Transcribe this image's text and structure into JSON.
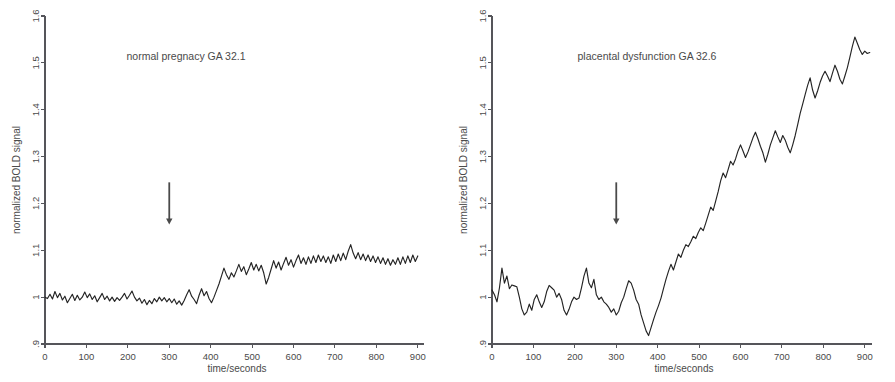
{
  "figure": {
    "panel_count": 2,
    "background_color": "#ffffff",
    "trace_color": "#242424",
    "axis_color": "#55555a",
    "text_color": "#4a4a4a"
  },
  "panels": [
    {
      "key": "normal",
      "title": "normal pregnacy GA 32.1",
      "xlabel": "time/seconds",
      "ylabel": "normalized BOLD signal",
      "annotation": {
        "label": "onset-arrow",
        "x": 300,
        "y_top": 1.245,
        "y_bottom": 1.155
      }
    },
    {
      "key": "dysfunction",
      "title": "placental dysfunction GA 32.6",
      "xlabel": "time/seconds",
      "ylabel": "normalized BOLD signal",
      "annotation": {
        "label": "onset-arrow",
        "x": 300,
        "y_top": 1.245,
        "y_bottom": 1.155
      }
    }
  ],
  "chart_data": [
    {
      "type": "line",
      "title": "normal pregnacy GA 32.1",
      "xlabel": "time/seconds",
      "ylabel": "normalized BOLD signal",
      "xlim": [
        0,
        915
      ],
      "ylim": [
        0.9,
        1.6
      ],
      "xticks": [
        0,
        100,
        200,
        300,
        400,
        500,
        600,
        700,
        800,
        900
      ],
      "xticklabels": [
        "0",
        "100",
        "200",
        "300",
        "400",
        "500",
        "600",
        "700",
        "800",
        "900"
      ],
      "yticks": [
        0.9,
        1.0,
        1.1,
        1.2,
        1.3,
        1.4,
        1.5,
        1.6
      ],
      "yticklabels": [
        ".9",
        "1",
        "1.1",
        "1.2",
        "1.3",
        "1.4",
        "1.5",
        "1.6"
      ],
      "grid": false,
      "legend": "none",
      "annotations": [
        {
          "type": "arrow",
          "text": "",
          "x": 300,
          "y_from": 1.245,
          "y_to": 1.155,
          "direction": "down"
        }
      ],
      "series": [
        {
          "name": "normalized BOLD signal",
          "x": [
            0,
            6,
            12,
            18,
            24,
            30,
            36,
            42,
            48,
            54,
            60,
            66,
            72,
            78,
            84,
            90,
            96,
            102,
            108,
            114,
            120,
            126,
            132,
            138,
            144,
            150,
            156,
            162,
            168,
            174,
            180,
            186,
            192,
            198,
            204,
            210,
            216,
            222,
            228,
            234,
            240,
            246,
            252,
            258,
            264,
            270,
            276,
            282,
            288,
            294,
            300,
            306,
            312,
            318,
            324,
            330,
            336,
            342,
            348,
            354,
            360,
            366,
            372,
            378,
            384,
            390,
            396,
            402,
            408,
            414,
            420,
            426,
            432,
            438,
            444,
            450,
            456,
            462,
            468,
            474,
            480,
            486,
            492,
            498,
            504,
            510,
            516,
            522,
            528,
            534,
            540,
            546,
            552,
            558,
            564,
            570,
            576,
            582,
            588,
            594,
            600,
            606,
            612,
            618,
            624,
            630,
            636,
            642,
            648,
            654,
            660,
            666,
            672,
            678,
            684,
            690,
            696,
            702,
            708,
            714,
            720,
            726,
            732,
            738,
            744,
            750,
            756,
            762,
            768,
            774,
            780,
            786,
            792,
            798,
            804,
            810,
            816,
            822,
            828,
            834,
            840,
            846,
            852,
            858,
            864,
            870,
            876,
            882,
            888,
            894,
            900,
            906,
            912
          ],
          "y": [
            1.0,
            0.997,
            1.006,
            0.996,
            1.012,
            0.999,
            1.008,
            0.994,
            1.002,
            0.988,
            0.997,
            1.006,
            0.993,
            1.004,
            0.994,
            1.0,
            1.011,
            0.999,
            1.007,
            0.995,
            1.003,
            0.99,
            0.999,
            1.008,
            0.995,
            1.002,
            0.992,
            1.0,
            0.991,
            0.999,
            0.993,
            1.0,
            1.008,
            0.996,
            1.004,
            1.013,
            1.0,
            0.992,
            0.998,
            0.987,
            0.995,
            0.984,
            0.993,
            0.986,
            0.997,
            0.99,
            1.0,
            0.992,
            0.999,
            0.99,
            0.997,
            0.988,
            0.996,
            0.985,
            0.992,
            0.983,
            0.993,
            1.005,
            1.016,
            1.002,
            0.995,
            0.986,
            1.004,
            1.018,
            1.003,
            1.012,
            0.997,
            0.988,
            1.0,
            1.014,
            1.028,
            1.045,
            1.062,
            1.048,
            1.038,
            1.052,
            1.043,
            1.056,
            1.07,
            1.055,
            1.065,
            1.048,
            1.06,
            1.074,
            1.058,
            1.07,
            1.056,
            1.068,
            1.052,
            1.028,
            1.042,
            1.06,
            1.078,
            1.062,
            1.075,
            1.058,
            1.072,
            1.085,
            1.068,
            1.08,
            1.064,
            1.078,
            1.09,
            1.072,
            1.084,
            1.07,
            1.086,
            1.072,
            1.088,
            1.074,
            1.09,
            1.076,
            1.088,
            1.074,
            1.086,
            1.072,
            1.09,
            1.076,
            1.092,
            1.078,
            1.094,
            1.08,
            1.098,
            1.112,
            1.094,
            1.082,
            1.095,
            1.08,
            1.092,
            1.078,
            1.09,
            1.076,
            1.088,
            1.074,
            1.086,
            1.072,
            1.084,
            1.07,
            1.082,
            1.068,
            1.08,
            1.07,
            1.084,
            1.07,
            1.086,
            1.072,
            1.088,
            1.074,
            1.09,
            1.076,
            1.088
          ]
        }
      ]
    },
    {
      "type": "line",
      "title": "placental dysfunction GA 32.6",
      "xlabel": "time/seconds",
      "ylabel": "normalized BOLD signal",
      "xlim": [
        0,
        915
      ],
      "ylim": [
        0.9,
        1.6
      ],
      "xticks": [
        0,
        100,
        200,
        300,
        400,
        500,
        600,
        700,
        800,
        900
      ],
      "xticklabels": [
        "0",
        "100",
        "200",
        "300",
        "400",
        "500",
        "600",
        "700",
        "800",
        "900"
      ],
      "yticks": [
        0.9,
        1.0,
        1.1,
        1.2,
        1.3,
        1.4,
        1.5,
        1.6
      ],
      "yticklabels": [
        ".9",
        "1",
        "1.1",
        "1.2",
        "1.3",
        "1.4",
        "1.5",
        "1.6"
      ],
      "grid": false,
      "legend": "none",
      "annotations": [
        {
          "type": "arrow",
          "text": "",
          "x": 300,
          "y_from": 1.245,
          "y_to": 1.155,
          "direction": "down"
        }
      ],
      "series": [
        {
          "name": "normalized BOLD signal",
          "x": [
            0,
            6,
            12,
            18,
            24,
            30,
            36,
            42,
            48,
            54,
            60,
            66,
            72,
            78,
            84,
            90,
            96,
            102,
            108,
            114,
            120,
            126,
            132,
            138,
            144,
            150,
            156,
            162,
            168,
            174,
            180,
            186,
            192,
            198,
            204,
            210,
            216,
            222,
            228,
            234,
            240,
            246,
            252,
            258,
            264,
            270,
            276,
            282,
            288,
            294,
            300,
            306,
            312,
            318,
            324,
            330,
            336,
            342,
            348,
            354,
            360,
            366,
            372,
            378,
            384,
            390,
            396,
            402,
            408,
            414,
            420,
            426,
            432,
            438,
            444,
            450,
            456,
            462,
            468,
            474,
            480,
            486,
            492,
            498,
            504,
            510,
            516,
            522,
            528,
            534,
            540,
            546,
            552,
            558,
            564,
            570,
            576,
            582,
            588,
            594,
            600,
            606,
            612,
            618,
            624,
            630,
            636,
            642,
            648,
            654,
            660,
            666,
            672,
            678,
            684,
            690,
            696,
            702,
            708,
            714,
            720,
            726,
            732,
            738,
            744,
            750,
            756,
            762,
            768,
            774,
            780,
            786,
            792,
            798,
            804,
            810,
            816,
            822,
            828,
            834,
            840,
            846,
            852,
            858,
            864,
            870,
            876,
            882,
            888,
            894,
            900,
            906,
            912
          ],
          "y": [
            1.015,
            1.005,
            0.99,
            1.02,
            1.062,
            1.03,
            1.045,
            1.018,
            1.026,
            1.024,
            1.022,
            1.0,
            0.975,
            0.962,
            0.968,
            0.985,
            0.972,
            0.995,
            1.005,
            0.99,
            0.978,
            0.99,
            1.012,
            1.025,
            1.02,
            1.015,
            1.0,
            1.008,
            0.995,
            0.972,
            0.962,
            0.974,
            0.99,
            1.0,
            0.995,
            0.998,
            1.02,
            1.045,
            1.062,
            1.03,
            1.02,
            1.038,
            1.005,
            0.995,
            1.0,
            0.99,
            0.985,
            0.978,
            0.968,
            0.975,
            0.962,
            0.97,
            0.988,
            1.0,
            1.018,
            1.035,
            1.03,
            1.015,
            0.995,
            0.985,
            0.962,
            0.945,
            0.928,
            0.918,
            0.935,
            0.952,
            0.968,
            0.982,
            0.998,
            1.018,
            1.038,
            1.055,
            1.07,
            1.058,
            1.075,
            1.092,
            1.085,
            1.1,
            1.112,
            1.108,
            1.118,
            1.13,
            1.125,
            1.138,
            1.148,
            1.142,
            1.158,
            1.175,
            1.192,
            1.185,
            1.205,
            1.225,
            1.248,
            1.265,
            1.255,
            1.272,
            1.29,
            1.282,
            1.295,
            1.312,
            1.325,
            1.312,
            1.298,
            1.31,
            1.325,
            1.34,
            1.352,
            1.338,
            1.322,
            1.308,
            1.288,
            1.305,
            1.325,
            1.34,
            1.355,
            1.342,
            1.33,
            1.345,
            1.335,
            1.32,
            1.308,
            1.325,
            1.345,
            1.368,
            1.392,
            1.412,
            1.432,
            1.452,
            1.468,
            1.442,
            1.425,
            1.44,
            1.458,
            1.472,
            1.482,
            1.472,
            1.46,
            1.478,
            1.495,
            1.482,
            1.465,
            1.455,
            1.472,
            1.49,
            1.512,
            1.535,
            1.555,
            1.542,
            1.528,
            1.518,
            1.525,
            1.52,
            1.522,
            1.515,
            1.49,
            1.44,
            1.398,
            1.382,
            1.46,
            1.5,
            1.542
          ]
        }
      ]
    }
  ]
}
